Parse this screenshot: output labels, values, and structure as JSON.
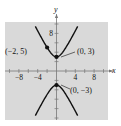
{
  "chart_data": {
    "type": "line",
    "title": "",
    "xlabel": "x",
    "ylabel": "y",
    "xlim": [
      -11,
      11
    ],
    "ylim": [
      -10.5,
      10.5
    ],
    "grid": false,
    "background": "#d9d9d9",
    "x_tick_step": 2,
    "y_tick_step": 2,
    "x_tick_labels": [
      {
        "value": -8,
        "label": "−8"
      },
      {
        "value": -4,
        "label": "−4"
      },
      {
        "value": 4,
        "label": "4"
      },
      {
        "value": 8,
        "label": "8"
      }
    ],
    "y_tick_labels": [
      {
        "value": 8,
        "label": "8"
      }
    ],
    "series": [
      {
        "name": "upper branch",
        "equation": "y^2/9 - 4x^2/9 = 1",
        "branch": "upper",
        "color": "#111111"
      },
      {
        "name": "lower branch",
        "equation": "y^2/9 - 4x^2/9 = 1",
        "branch": "lower",
        "color": "#111111"
      }
    ],
    "points": [
      {
        "x": -2,
        "y": 5,
        "label": "(−2, 5)"
      },
      {
        "x": 0,
        "y": 3,
        "label": "(0, 3)"
      },
      {
        "x": 0,
        "y": -3,
        "label": "(0, −3)"
      }
    ]
  }
}
